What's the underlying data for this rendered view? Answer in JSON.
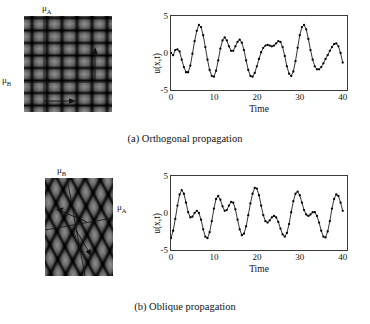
{
  "figure": {
    "panels": [
      {
        "id": "a",
        "caption": "(a) Orthogonal propagation",
        "pattern": {
          "name": "orthogonal-interference-pattern",
          "labels": [
            {
              "text": "μ",
              "sub": "A",
              "position": "top"
            },
            {
              "text": "μ",
              "sub": "B",
              "position": "left"
            }
          ]
        },
        "chart": {
          "ylabel": "u(x,t)",
          "xlabel": "Time",
          "yticks": [
            "5",
            "0",
            "-5"
          ],
          "xticks": [
            "0",
            "10",
            "20",
            "30",
            "40"
          ]
        }
      },
      {
        "id": "b",
        "caption": "(b) Oblique propagation",
        "pattern": {
          "name": "oblique-interference-pattern",
          "labels": [
            {
              "text": "μ",
              "sub": "B",
              "position": "top"
            },
            {
              "text": "μ",
              "sub": "A",
              "position": "right"
            }
          ]
        },
        "chart": {
          "ylabel": "u(x,t)",
          "xlabel": "Time",
          "yticks": [
            "5",
            "0",
            "-5"
          ],
          "xticks": [
            "0",
            "10",
            "20",
            "30",
            "40"
          ]
        }
      }
    ]
  },
  "chart_data": [
    {
      "type": "line",
      "title": "",
      "subtitle": "",
      "panel": "a",
      "xlabel": "Time",
      "ylabel": "u(x,t)",
      "xlim": [
        0,
        41
      ],
      "ylim": [
        -5,
        5
      ],
      "xticks": [
        0,
        10,
        20,
        30,
        40
      ],
      "yticks": [
        -5,
        0,
        5
      ],
      "grid": false,
      "legend": null,
      "markers": "filled-circle",
      "marker_color": "#000000",
      "line_color": "#000000",
      "x": [
        0,
        0.5,
        1,
        1.5,
        2,
        2.5,
        3,
        3.5,
        4,
        4.5,
        5,
        5.5,
        6,
        6.5,
        7,
        7.5,
        8,
        8.5,
        9,
        9.5,
        10,
        10.5,
        11,
        11.5,
        12,
        12.5,
        13,
        13.5,
        14,
        14.5,
        15,
        15.5,
        16,
        16.5,
        17,
        17.5,
        18,
        18.5,
        19,
        19.5,
        20,
        20.5,
        21,
        21.5,
        22,
        22.5,
        23,
        23.5,
        24,
        24.5,
        25,
        25.5,
        26,
        26.5,
        27,
        27.5,
        28,
        28.5,
        29,
        29.5,
        30,
        30.5,
        31,
        31.5,
        32,
        32.5,
        33,
        33.5,
        34,
        34.5,
        35,
        35.5,
        36,
        36.5,
        37,
        37.5,
        38,
        38.5,
        39,
        39.5,
        40
      ],
      "y": [
        0.0,
        -0.3,
        0.4,
        0.5,
        0.2,
        -0.9,
        -1.9,
        -2.6,
        -2.6,
        -1.7,
        -0.1,
        1.6,
        3.0,
        3.8,
        3.5,
        2.4,
        0.8,
        -0.9,
        -2.3,
        -3.1,
        -3.2,
        -2.4,
        -1.0,
        0.6,
        1.7,
        2.1,
        1.7,
        0.9,
        0.3,
        0.3,
        0.9,
        1.5,
        1.8,
        1.4,
        0.4,
        -1.0,
        -2.3,
        -3.1,
        -3.2,
        -2.7,
        -1.8,
        -0.8,
        0.1,
        0.7,
        1.0,
        1.1,
        1.0,
        0.9,
        1.0,
        1.3,
        1.6,
        1.5,
        0.8,
        -0.4,
        -1.8,
        -2.8,
        -3.1,
        -2.5,
        -1.1,
        0.7,
        2.4,
        3.5,
        3.8,
        3.2,
        1.9,
        0.4,
        -0.9,
        -1.8,
        -2.2,
        -2.2,
        -1.9,
        -1.4,
        -0.8,
        -0.3,
        0.3,
        0.8,
        1.2,
        1.3,
        0.9,
        0.0,
        -1.3
      ]
    },
    {
      "type": "line",
      "title": "",
      "subtitle": "",
      "panel": "b",
      "xlabel": "Time",
      "ylabel": "u(x,t)",
      "xlim": [
        0,
        41
      ],
      "ylim": [
        -5,
        5
      ],
      "xticks": [
        0,
        10,
        20,
        30,
        40
      ],
      "yticks": [
        -5,
        0,
        5
      ],
      "grid": false,
      "legend": null,
      "markers": "filled-circle",
      "marker_color": "#000000",
      "line_color": "#000000",
      "x": [
        0,
        0.5,
        1,
        1.5,
        2,
        2.5,
        3,
        3.5,
        4,
        4.5,
        5,
        5.5,
        6,
        6.5,
        7,
        7.5,
        8,
        8.5,
        9,
        9.5,
        10,
        10.5,
        11,
        11.5,
        12,
        12.5,
        13,
        13.5,
        14,
        14.5,
        15,
        15.5,
        16,
        16.5,
        17,
        17.5,
        18,
        18.5,
        19,
        19.5,
        20,
        20.5,
        21,
        21.5,
        22,
        22.5,
        23,
        23.5,
        24,
        24.5,
        25,
        25.5,
        26,
        26.5,
        27,
        27.5,
        28,
        28.5,
        29,
        29.5,
        30,
        30.5,
        31,
        31.5,
        32,
        32.5,
        33,
        33.5,
        34,
        34.5,
        35,
        35.5,
        36,
        36.5,
        37,
        37.5,
        38,
        38.5,
        39,
        39.5,
        40
      ],
      "y": [
        -3.4,
        -2.4,
        -0.8,
        1.0,
        2.5,
        3.1,
        2.6,
        1.4,
        0.1,
        -0.6,
        -0.5,
        0.0,
        0.3,
        0.0,
        -0.9,
        -2.2,
        -3.2,
        -3.4,
        -2.6,
        -1.1,
        0.6,
        1.9,
        2.3,
        1.8,
        0.9,
        0.3,
        0.4,
        1.0,
        1.5,
        1.4,
        0.5,
        -0.9,
        -2.2,
        -3.0,
        -2.8,
        -1.8,
        -0.3,
        1.3,
        2.6,
        3.4,
        3.3,
        2.4,
        1.0,
        -0.3,
        -1.1,
        -1.3,
        -1.0,
        -0.6,
        -0.4,
        -0.6,
        -1.2,
        -2.1,
        -2.9,
        -3.2,
        -2.7,
        -1.5,
        0.1,
        1.6,
        2.6,
        2.9,
        2.4,
        1.4,
        0.4,
        -0.2,
        -0.4,
        -0.2,
        0.1,
        0.1,
        -0.4,
        -1.3,
        -2.4,
        -3.2,
        -3.3,
        -2.5,
        -1.1,
        0.6,
        1.9,
        2.5,
        2.3,
        1.4,
        0.3
      ]
    }
  ]
}
